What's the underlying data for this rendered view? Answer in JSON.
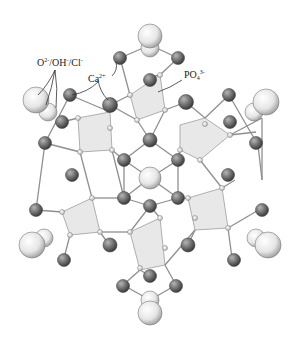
{
  "figure": {
    "labels": [
      {
        "id": "anion",
        "base": "O",
        "sup1": "2-",
        "mid": "/OH",
        "sup2": "-",
        "end": "/Cl",
        "sup3": "-",
        "x": 37,
        "y": 60
      },
      {
        "id": "calcium",
        "base": "Ca",
        "sup1": "2+",
        "x": 88,
        "y": 76
      },
      {
        "id": "phosphate",
        "base": "PO",
        "sub": "4",
        "sup1": "3-",
        "x": 184,
        "y": 72
      }
    ],
    "colors": {
      "background": "#ffffff",
      "anion_atom": "#eeeeee",
      "calcium_atom": "#6e6e6e",
      "oxygen_small": "#f4f4f4",
      "bond": "#9a9a9a",
      "tetrahedron_fill": "#e6e6e6",
      "label_text": "#222222"
    }
  }
}
